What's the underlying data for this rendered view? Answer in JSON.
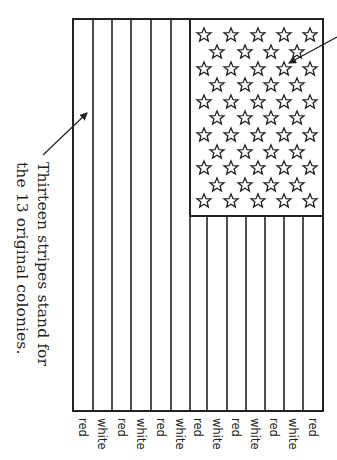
{
  "diagram": {
    "caption_lines": [
      "Thirteen stripes stand for",
      "the 13 original colonies."
    ],
    "stripe_labels": [
      "red",
      "white",
      "red",
      "white",
      "red",
      "white",
      "red",
      "white",
      "red",
      "white",
      "red",
      "white",
      "red"
    ],
    "stripe_count": 13,
    "star_count": 50,
    "colors": {
      "line": "#222222",
      "background": "#ffffff"
    }
  }
}
